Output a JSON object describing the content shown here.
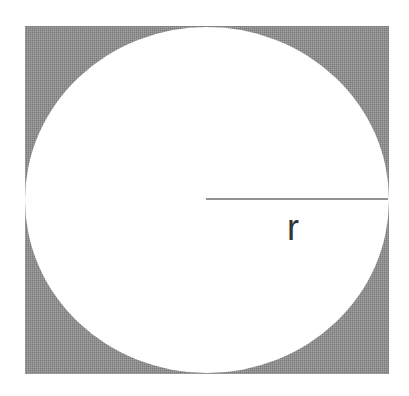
{
  "diagram": {
    "square": {
      "x": 25,
      "y": 26,
      "width": 364,
      "height": 348,
      "fill": "#8f8f8f"
    },
    "circle": {
      "cx": 207,
      "cy": 200,
      "rx": 182,
      "ry": 173,
      "fill": "#ffffff"
    },
    "radius_line": {
      "x1": 206,
      "y1": 199,
      "x2": 388,
      "y2": 199,
      "stroke": "#6e6e6e"
    },
    "radius_label": {
      "text": "r",
      "x": 287,
      "y": 240,
      "color": "#333333"
    }
  }
}
